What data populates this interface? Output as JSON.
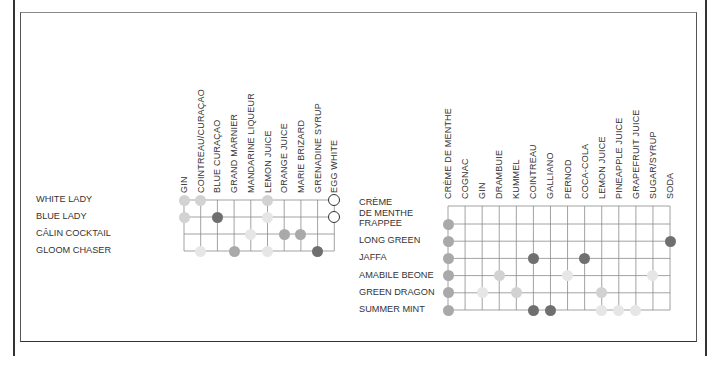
{
  "colors": {
    "very_light": "#e6e6e6",
    "light": "#d2d2d2",
    "medium": "#a9a9a9",
    "dark": "#6f6f6f",
    "grid": "#8a8a8a"
  },
  "left_chart": {
    "columns": [
      "GIN",
      "COINTREAU/CURAÇAO",
      "BLUE CURAÇAO",
      "GRAND MARNIER",
      "MANDARINE LIQUEUR",
      "LEMON JUICE",
      "ORANGE JUICE",
      "MARIE BRIZARD",
      "GRENADINE SYRUP",
      "EGG WHITE"
    ],
    "rows": [
      "WHITE LADY",
      "BLUE LADY",
      "CÂLIN COCKTAIL",
      "GLOOM CHASER"
    ],
    "dots": [
      {
        "row": 0,
        "col": 0,
        "shade": "light"
      },
      {
        "row": 0,
        "col": 1,
        "shade": "light"
      },
      {
        "row": 0,
        "col": 5,
        "shade": "light"
      },
      {
        "row": 0,
        "col": 9,
        "shade": "outline"
      },
      {
        "row": 1,
        "col": 0,
        "shade": "light"
      },
      {
        "row": 1,
        "col": 2,
        "shade": "dark"
      },
      {
        "row": 1,
        "col": 5,
        "shade": "very_light"
      },
      {
        "row": 1,
        "col": 9,
        "shade": "outline"
      },
      {
        "row": 2,
        "col": 4,
        "shade": "very_light"
      },
      {
        "row": 2,
        "col": 6,
        "shade": "medium"
      },
      {
        "row": 2,
        "col": 7,
        "shade": "medium"
      },
      {
        "row": 3,
        "col": 1,
        "shade": "very_light"
      },
      {
        "row": 3,
        "col": 3,
        "shade": "medium"
      },
      {
        "row": 3,
        "col": 5,
        "shade": "very_light"
      },
      {
        "row": 3,
        "col": 8,
        "shade": "dark"
      }
    ]
  },
  "right_chart": {
    "columns": [
      "CRÈME DE MENTHE",
      "COGNAC",
      "GIN",
      "DRAMBUIE",
      "KUMMEL",
      "COINTREAU",
      "GALLIANO",
      "PERNOD",
      "COCA-COLA",
      "LEMON JUICE",
      "PINEAPPLE JUICE",
      "GRAPEFRUIT JUICE",
      "SUGAR/SYRUP",
      "SODA"
    ],
    "rows": [
      {
        "lines": [
          "CRÈME",
          "DE MENTHE",
          "FRAPPEE"
        ]
      },
      {
        "lines": [
          "LONG GREEN"
        ]
      },
      {
        "lines": [
          "JAFFA"
        ]
      },
      {
        "lines": [
          "AMABILE BEONE"
        ]
      },
      {
        "lines": [
          "GREEN DRAGON"
        ]
      },
      {
        "lines": [
          "SUMMER MINT"
        ]
      }
    ],
    "dots": [
      {
        "row": 0,
        "col": 0,
        "shade": "medium"
      },
      {
        "row": 1,
        "col": 0,
        "shade": "medium"
      },
      {
        "row": 1,
        "col": 13,
        "shade": "dark"
      },
      {
        "row": 2,
        "col": 0,
        "shade": "medium"
      },
      {
        "row": 2,
        "col": 5,
        "shade": "dark"
      },
      {
        "row": 2,
        "col": 8,
        "shade": "dark"
      },
      {
        "row": 3,
        "col": 0,
        "shade": "medium"
      },
      {
        "row": 3,
        "col": 3,
        "shade": "light"
      },
      {
        "row": 3,
        "col": 7,
        "shade": "very_light"
      },
      {
        "row": 3,
        "col": 12,
        "shade": "very_light"
      },
      {
        "row": 4,
        "col": 0,
        "shade": "medium"
      },
      {
        "row": 4,
        "col": 2,
        "shade": "very_light"
      },
      {
        "row": 4,
        "col": 4,
        "shade": "light"
      },
      {
        "row": 4,
        "col": 9,
        "shade": "light"
      },
      {
        "row": 5,
        "col": 0,
        "shade": "medium"
      },
      {
        "row": 5,
        "col": 5,
        "shade": "dark"
      },
      {
        "row": 5,
        "col": 6,
        "shade": "dark"
      },
      {
        "row": 5,
        "col": 9,
        "shade": "very_light"
      },
      {
        "row": 5,
        "col": 10,
        "shade": "very_light"
      },
      {
        "row": 5,
        "col": 11,
        "shade": "very_light"
      }
    ]
  }
}
